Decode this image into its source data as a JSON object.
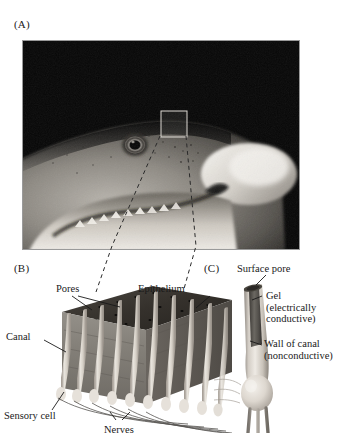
{
  "figure": {
    "kind": "scientific-figure",
    "background_color": "#ffffff",
    "ink_color": "#1a1a1a"
  },
  "panels": {
    "a": {
      "label": "(A)",
      "name": "shark-head-photograph",
      "description": "Black and white photograph of a shark head in profile facing right, showing the eye and a highlighted square region of skin pores on the snout",
      "photo": {
        "background_color": "#060606",
        "body_color": "#8c8a86",
        "highlight_color": "#e8e6e2",
        "inset_box": {
          "label": "",
          "stroke_color": "#d8d6d2"
        }
      }
    },
    "b": {
      "label": "(B)",
      "name": "skin-block-diagram",
      "description": "Three-dimensional cutaway block of shark skin showing pores on the epithelium surface, canals descending into the tissue, sensory cells and nerves",
      "annotations": [
        {
          "id": "pores",
          "text": "Pores"
        },
        {
          "id": "epithelium",
          "text": "Epithelium"
        },
        {
          "id": "canal",
          "text": "Canal"
        },
        {
          "id": "sensory-cell",
          "text": "Sensory cell"
        },
        {
          "id": "nerves",
          "text": "Nerves"
        }
      ],
      "colors": {
        "epithelium_top": "#3a3733",
        "block_side": "#7b756d",
        "canal": "#ded9d1",
        "canal_shadow": "#a9a298"
      }
    },
    "c": {
      "label": "(C)",
      "name": "single-canal-diagram",
      "description": "Close-up of a single ampullary canal opening at the surface pore, filled with conductive gel, surrounded by a nonconductive canal wall and ending in a bulbous ampulla",
      "annotations": [
        {
          "id": "surface-pore",
          "text": "Surface pore"
        },
        {
          "id": "gel",
          "text": "Gel\n(electrically\nconductive)",
          "lines": [
            "Gel",
            "(electrically",
            "conductive)"
          ]
        },
        {
          "id": "wall-of-canal",
          "text": "Wall of canal\n(nonconductive)",
          "lines": [
            "Wall of canal",
            "(nonconductive)"
          ]
        }
      ],
      "colors": {
        "gel": "#595651",
        "wall": "#cfc9c1",
        "ampulla": "#e3ded6"
      }
    }
  }
}
